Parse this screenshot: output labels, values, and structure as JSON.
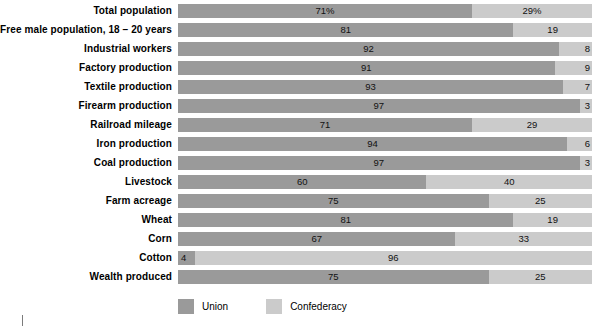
{
  "chart_data": {
    "type": "bar",
    "subtype": "horizontal-stacked-100",
    "title": "",
    "xlabel": "",
    "ylabel": "",
    "xlim": [
      0,
      100
    ],
    "grid": false,
    "legend_position": "bottom-left",
    "categories": [
      "Total population",
      "Free male population, 18 – 20 years",
      "Industrial workers",
      "Factory production",
      "Textile production",
      "Firearm production",
      "Railroad mileage",
      "Iron production",
      "Coal production",
      "Livestock",
      "Farm acreage",
      "Wheat",
      "Corn",
      "Cotton",
      "Wealth produced"
    ],
    "series": [
      {
        "name": "Union",
        "color": "#9a9a9a",
        "values": [
          71,
          81,
          92,
          91,
          93,
          97,
          71,
          94,
          97,
          60,
          75,
          81,
          67,
          4,
          75
        ],
        "labels": [
          "71%",
          "81",
          "92",
          "91",
          "93",
          "97",
          "71",
          "94",
          "97",
          "60",
          "75",
          "81",
          "67",
          "4",
          "75"
        ]
      },
      {
        "name": "Confederacy",
        "color": "#cbcbcb",
        "values": [
          29,
          19,
          8,
          9,
          7,
          3,
          29,
          6,
          3,
          40,
          25,
          19,
          33,
          96,
          25
        ],
        "labels": [
          "29%",
          "19",
          "8",
          "9",
          "7",
          "3",
          "29",
          "6",
          "3",
          "40",
          "25",
          "19",
          "33",
          "96",
          "25"
        ]
      }
    ]
  },
  "legend": {
    "items": [
      {
        "label": "Union",
        "color": "#9a9a9a"
      },
      {
        "label": "Confederacy",
        "color": "#cbcbcb"
      }
    ]
  }
}
